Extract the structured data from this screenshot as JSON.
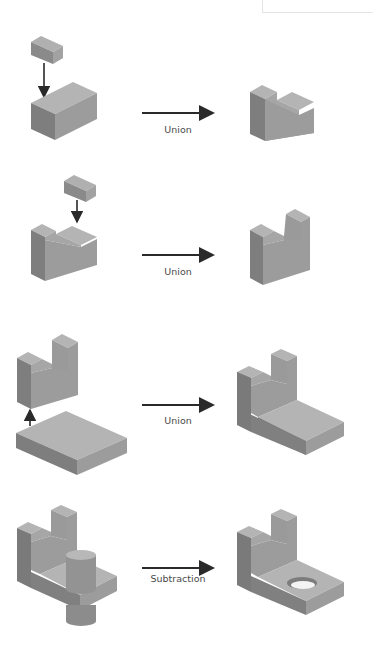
{
  "diagram": {
    "type": "csg-operations",
    "colors": {
      "top": "#b4b4b4",
      "left": "#7e7e7e",
      "right": "#9c9c9c",
      "arrow": "#2a2a2a",
      "label": "#4a4a4a"
    },
    "steps": [
      {
        "operation": "Union",
        "input": "small block dropped onto rectangular block",
        "result": "L-shaped block"
      },
      {
        "operation": "Union",
        "input": "small block dropped onto L-shaped block",
        "result": "U-notched block"
      },
      {
        "operation": "Union",
        "input": "U-notched block joined to flat base plate",
        "result": "bracket with base"
      },
      {
        "operation": "Subtraction",
        "input": "cylinder through bracket base",
        "result": "bracket with hole"
      }
    ]
  }
}
